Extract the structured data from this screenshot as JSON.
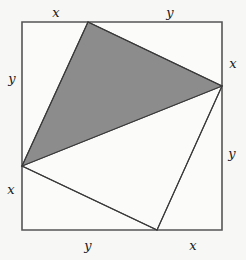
{
  "figure": {
    "canvas": {
      "width": 246,
      "height": 260
    },
    "background_color": "#f7f7f5",
    "stroke_color": "#555555",
    "shaded_fill_color": "#8c8c8c",
    "unshaded_fill_color": "#fbfbfa",
    "label_color": "#1a1a1a"
  },
  "square": {
    "name": "outer-square",
    "points": "22,22 222,22 222,230 22,230",
    "stroke_width": 1.6
  },
  "quadrilateral": {
    "name": "inscribed-quadrilateral",
    "points": "88,22 222,86 157,230 22,166",
    "stroke_width": 1.2,
    "vertices": [
      {
        "name": "top-vertex",
        "x": 88,
        "y": 22,
        "on_side": "top"
      },
      {
        "name": "right-vertex",
        "x": 222,
        "y": 86,
        "on_side": "right"
      },
      {
        "name": "bottom-vertex",
        "x": 157,
        "y": 230,
        "on_side": "bottom"
      },
      {
        "name": "left-vertex",
        "x": 22,
        "y": 166,
        "on_side": "left"
      }
    ]
  },
  "shaded_triangle": {
    "name": "shaded-triangle",
    "points": "88,22 222,86 22,166",
    "stroke_width": 1.2
  },
  "unshaded_triangle": {
    "name": "unshaded-triangle",
    "points": "222,86 157,230 22,166",
    "stroke_width": 1.2
  },
  "labels": [
    {
      "name": "label-top-left-x",
      "text": "x",
      "x": 56,
      "y": 12,
      "side": "top",
      "segment": "left"
    },
    {
      "name": "label-top-right-y",
      "text": "y",
      "x": 170,
      "y": 12,
      "side": "top",
      "segment": "right"
    },
    {
      "name": "label-left-top-y",
      "text": "y",
      "x": 12,
      "y": 78,
      "side": "left",
      "segment": "top"
    },
    {
      "name": "label-left-bottom-x",
      "text": "x",
      "x": 11,
      "y": 189,
      "side": "left",
      "segment": "bottom"
    },
    {
      "name": "label-right-top-x",
      "text": "x",
      "x": 233,
      "y": 63,
      "side": "right",
      "segment": "top"
    },
    {
      "name": "label-right-bottom-y",
      "text": "y",
      "x": 232,
      "y": 153,
      "side": "right",
      "segment": "bottom"
    },
    {
      "name": "label-bottom-left-y",
      "text": "y",
      "x": 88,
      "y": 245,
      "side": "bottom",
      "segment": "left"
    },
    {
      "name": "label-bottom-right-x",
      "text": "x",
      "x": 193,
      "y": 245,
      "side": "bottom",
      "segment": "right"
    }
  ]
}
